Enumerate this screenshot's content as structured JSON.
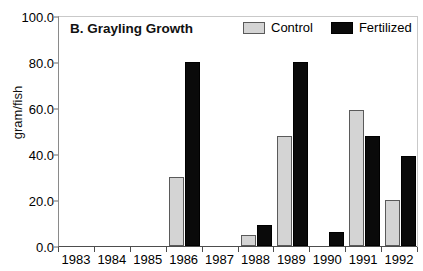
{
  "chart_data": {
    "type": "bar",
    "title": "B. Grayling Growth",
    "xlabel": "",
    "ylabel": "gram/fish",
    "categories": [
      "1983",
      "1984",
      "1985",
      "1986",
      "1987",
      "1988",
      "1989",
      "1990",
      "1991",
      "1992"
    ],
    "series": [
      {
        "name": "Control",
        "color": "#d4d4d4",
        "values": [
          0,
          0,
          0,
          30,
          0,
          5,
          48,
          0,
          59,
          20
        ]
      },
      {
        "name": "Fertilized",
        "color": "#0a0a0a",
        "values": [
          0,
          0,
          0,
          80,
          0,
          9,
          80,
          6,
          48,
          39
        ]
      }
    ],
    "ylim": [
      0,
      100
    ],
    "yticks": [
      0,
      20,
      40,
      60,
      80,
      100
    ],
    "ytick_labels": [
      "0.0",
      "20.0",
      "40.0",
      "60.0",
      "80.0",
      "100.0"
    ],
    "grid": false,
    "legend_position": "top-right"
  },
  "legend": {
    "items": [
      {
        "label": "Control",
        "swatch": "control"
      },
      {
        "label": "Fertilized",
        "swatch": "fertilized"
      }
    ]
  }
}
